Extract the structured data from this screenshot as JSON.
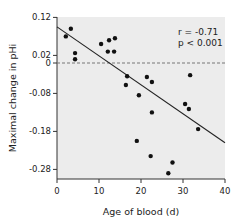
{
  "chart_data": {
    "type": "scatter",
    "title": "",
    "xlabel": "Age of blood (d)",
    "ylabel": "Maximal change in pHi",
    "xlim": [
      0,
      40
    ],
    "ylim": [
      -0.32,
      0.12
    ],
    "xticks": [
      0,
      10,
      20,
      30,
      40
    ],
    "yticks": [
      0.12,
      0.02,
      0,
      -0.08,
      -0.18,
      -0.28
    ],
    "ytick_labels": [
      "0.12",
      "0.02",
      "0",
      "-0.08",
      "-0.18",
      "-0.28"
    ],
    "grid": false,
    "reference_line": {
      "y": 0,
      "style": "dashed"
    },
    "annotation": {
      "r": "r  = -0.71",
      "p": "p < 0.001"
    },
    "regression_line": {
      "x": [
        0,
        40
      ],
      "y": [
        0.095,
        -0.21
      ]
    },
    "points": [
      {
        "x": 2.1,
        "y": 0.07
      },
      {
        "x": 3.3,
        "y": 0.09
      },
      {
        "x": 4.3,
        "y": 0.026
      },
      {
        "x": 4.3,
        "y": 0.01
      },
      {
        "x": 10.5,
        "y": 0.05
      },
      {
        "x": 12.4,
        "y": 0.06
      },
      {
        "x": 13.8,
        "y": 0.065
      },
      {
        "x": 12.1,
        "y": 0.03
      },
      {
        "x": 13.6,
        "y": 0.03
      },
      {
        "x": 16.4,
        "y": -0.058
      },
      {
        "x": 16.7,
        "y": -0.035
      },
      {
        "x": 21.4,
        "y": -0.037
      },
      {
        "x": 22.6,
        "y": -0.05
      },
      {
        "x": 19.5,
        "y": -0.085
      },
      {
        "x": 31.7,
        "y": -0.032
      },
      {
        "x": 30.5,
        "y": -0.108
      },
      {
        "x": 31.4,
        "y": -0.121
      },
      {
        "x": 22.6,
        "y": -0.13
      },
      {
        "x": 33.6,
        "y": -0.174
      },
      {
        "x": 19.0,
        "y": -0.205
      },
      {
        "x": 22.3,
        "y": -0.245
      },
      {
        "x": 27.5,
        "y": -0.262
      },
      {
        "x": 26.5,
        "y": -0.29
      }
    ]
  }
}
